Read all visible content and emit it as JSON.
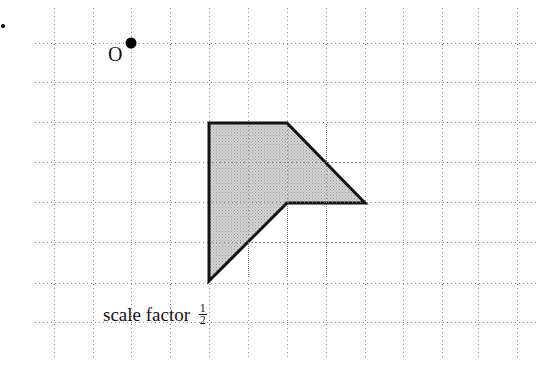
{
  "diagram": {
    "grid": {
      "spacing_px": 39,
      "vertical_x": [
        54,
        93,
        131,
        170,
        209,
        248,
        287,
        326,
        365,
        403,
        442,
        478,
        517
      ],
      "horizontal_y": [
        43,
        82,
        122,
        162,
        202,
        242,
        283,
        322
      ],
      "h_extent": [
        35,
        537
      ],
      "v_extent": [
        8,
        358
      ],
      "line_color": "#888888"
    },
    "center_point": {
      "label": "O",
      "x": 131,
      "y": 43
    },
    "stray_dot": {
      "x": 3,
      "y": 26
    },
    "shape": {
      "vertices": [
        [
          209,
          123
        ],
        [
          287,
          123
        ],
        [
          365,
          203
        ],
        [
          287,
          203
        ],
        [
          209,
          281
        ]
      ],
      "fill": "#c8c8c8",
      "stroke": "#111111"
    },
    "caption": {
      "text": "scale factor",
      "fraction_numerator": "1",
      "fraction_denominator": "2"
    }
  }
}
